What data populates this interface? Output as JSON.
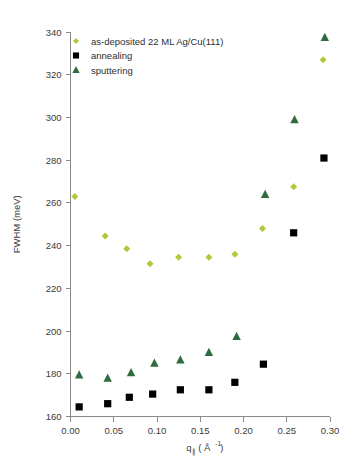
{
  "figure": {
    "background": "#ffffff",
    "width": 348,
    "height": 472
  },
  "legend": {
    "position": "top-left-inside",
    "entries": [
      {
        "label": "as-deposited 22 ML Ag/Cu(111)",
        "marker": "diamond",
        "color": "#b5c63a"
      },
      {
        "label": "annealing",
        "marker": "square",
        "color": "#000000"
      },
      {
        "label": "sputtering",
        "marker": "triangle",
        "color": "#2f6b3f"
      }
    ]
  },
  "axes": {
    "x": {
      "label_main": "q",
      "label_sub": "∥",
      "label_unit": "( Å",
      "label_exp": "-1",
      "label_close": " )",
      "full_label": "q∥ ( Å⁻¹ )",
      "ticks": [
        "0.00",
        "0.05",
        "0.10",
        "0.15",
        "0.20",
        "0.25",
        "0.30"
      ],
      "min": 0.0,
      "max": 0.3
    },
    "y": {
      "label": "FWHM (meV)",
      "ticks": [
        "160",
        "180",
        "200",
        "220",
        "240",
        "260",
        "280",
        "300",
        "320",
        "340"
      ],
      "min": 160,
      "max": 340
    }
  },
  "chart_data": {
    "type": "scatter",
    "title": "",
    "xlabel": "q∥ ( Å⁻¹ )",
    "ylabel": "FWHM (meV)",
    "xlim": [
      0.0,
      0.3
    ],
    "ylim": [
      160,
      340
    ],
    "grid": false,
    "legend_position": "upper left",
    "series": [
      {
        "name": "as-deposited 22 ML Ag/Cu(111)",
        "marker": "diamond",
        "color": "#b5c63a",
        "points": [
          {
            "x": 0.005,
            "y": 263
          },
          {
            "x": 0.04,
            "y": 244.5
          },
          {
            "x": 0.065,
            "y": 238.5
          },
          {
            "x": 0.092,
            "y": 231.5
          },
          {
            "x": 0.125,
            "y": 234.5
          },
          {
            "x": 0.16,
            "y": 234.5
          },
          {
            "x": 0.19,
            "y": 236
          },
          {
            "x": 0.222,
            "y": 248
          },
          {
            "x": 0.258,
            "y": 267.5
          },
          {
            "x": 0.292,
            "y": 327
          }
        ]
      },
      {
        "name": "annealing",
        "marker": "square",
        "color": "#000000",
        "points": [
          {
            "x": 0.01,
            "y": 164.5
          },
          {
            "x": 0.043,
            "y": 166
          },
          {
            "x": 0.068,
            "y": 169
          },
          {
            "x": 0.095,
            "y": 170.5
          },
          {
            "x": 0.127,
            "y": 172.5
          },
          {
            "x": 0.16,
            "y": 172.5
          },
          {
            "x": 0.19,
            "y": 176
          },
          {
            "x": 0.223,
            "y": 184.5
          },
          {
            "x": 0.258,
            "y": 246
          },
          {
            "x": 0.293,
            "y": 281
          }
        ]
      },
      {
        "name": "sputtering",
        "marker": "triangle",
        "color": "#2f6b3f",
        "points": [
          {
            "x": 0.01,
            "y": 179.5
          },
          {
            "x": 0.043,
            "y": 178
          },
          {
            "x": 0.07,
            "y": 180.5
          },
          {
            "x": 0.097,
            "y": 185
          },
          {
            "x": 0.127,
            "y": 186.5
          },
          {
            "x": 0.16,
            "y": 190
          },
          {
            "x": 0.192,
            "y": 197.5
          },
          {
            "x": 0.225,
            "y": 264
          },
          {
            "x": 0.259,
            "y": 299
          },
          {
            "x": 0.294,
            "y": 337.5
          }
        ]
      }
    ]
  }
}
